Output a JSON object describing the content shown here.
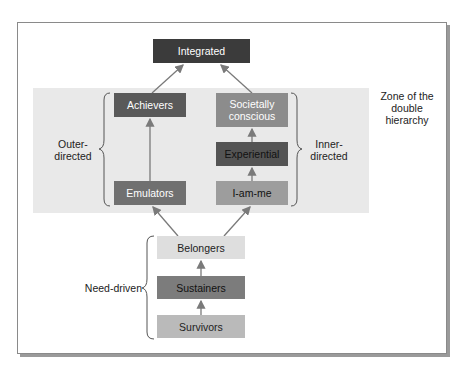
{
  "nodes": {
    "integrated": {
      "label": "Integrated",
      "bg": "#3b3b3b",
      "fg": "#ffffff"
    },
    "achievers": {
      "label": "Achievers",
      "bg": "#595959",
      "fg": "#ffffff"
    },
    "societally_conscious": {
      "label": "Societally conscious",
      "line1": "Societally",
      "line2": "conscious",
      "bg": "#8c8c8c",
      "fg": "#ffffff"
    },
    "experiential": {
      "label": "Experiential",
      "bg": "#545454",
      "fg": "#111111"
    },
    "emulators": {
      "label": "Emulators",
      "bg": "#707070",
      "fg": "#ffffff"
    },
    "i_am_me": {
      "label": "I-am-me",
      "bg": "#9d9d9d",
      "fg": "#111111"
    },
    "belongers": {
      "label": "Belongers",
      "bg": "#dedede",
      "fg": "#222222"
    },
    "sustainers": {
      "label": "Sustainers",
      "bg": "#7c7c7c",
      "fg": "#111111"
    },
    "survivors": {
      "label": "Survivors",
      "bg": "#bababa",
      "fg": "#222222"
    }
  },
  "groups": {
    "outer_directed": {
      "line1": "Outer-",
      "line2": "directed"
    },
    "inner_directed": {
      "line1": "Inner-",
      "line2": "directed"
    },
    "need_driven": {
      "label": "Need-driven"
    },
    "zone": {
      "line1": "Zone of the",
      "line2": "double",
      "line3": "hierarchy",
      "bg": "#e9e9e9"
    }
  },
  "edges": [
    {
      "from": "survivors",
      "to": "sustainers"
    },
    {
      "from": "sustainers",
      "to": "belongers"
    },
    {
      "from": "belongers",
      "to": "emulators"
    },
    {
      "from": "belongers",
      "to": "i_am_me"
    },
    {
      "from": "emulators",
      "to": "achievers"
    },
    {
      "from": "i_am_me",
      "to": "experiential"
    },
    {
      "from": "experiential",
      "to": "societally_conscious"
    },
    {
      "from": "achievers",
      "to": "integrated"
    },
    {
      "from": "societally_conscious",
      "to": "integrated"
    }
  ],
  "colors": {
    "arrow": "#7a7a7a",
    "frame": "#8a8a8a",
    "brace": "#555555"
  }
}
